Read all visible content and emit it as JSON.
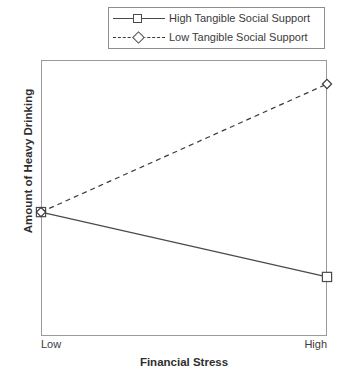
{
  "chart_data": {
    "type": "line",
    "title": "",
    "xlabel": "Financial Stress",
    "ylabel": "Amount of Heavy Drinking",
    "categories": [
      "Low",
      "High"
    ],
    "x": [
      0,
      1
    ],
    "xlim": [
      0,
      1
    ],
    "ylim": [
      0,
      1
    ],
    "grid": false,
    "legend_position": "top-right",
    "axis_ticks_visible": false,
    "y_axis_values_shown": false,
    "series": [
      {
        "name": "High Tangible Social Support",
        "values": [
          0.449,
          0.214
        ],
        "line_style": "solid",
        "marker": "square",
        "marker_fill": "#ffffff",
        "color": "#4a4a4a"
      },
      {
        "name": "Low Tangible Social Support",
        "values": [
          0.449,
          0.913
        ],
        "line_style": "dashed",
        "marker": "diamond",
        "marker_fill": "#ffffff",
        "color": "#3a3a3a"
      }
    ],
    "annotations": [
      "Both series originate from the same point at Low financial stress",
      "High Tangible Social Support decreases as financial stress rises",
      "Low Tangible Social Support increases as financial stress rises"
    ]
  },
  "legend": {
    "entries": [
      {
        "label": "High Tangible Social Support",
        "style": "solid",
        "marker": "square"
      },
      {
        "label": "Low Tangible Social Support",
        "style": "dashed",
        "marker": "diamond"
      }
    ]
  },
  "axes": {
    "x_label": "Financial Stress",
    "y_label": "Amount of Heavy Drinking",
    "x_tick_low": "Low",
    "x_tick_high": "High"
  },
  "colors": {
    "frame": "#9a9a9a",
    "legend_border": "#8d8d8d",
    "series_high": "#4a4a4a",
    "series_low": "#3a3a3a",
    "text": "#3b3b3b",
    "marker_fill": "#ffffff",
    "background": "#ffffff"
  }
}
